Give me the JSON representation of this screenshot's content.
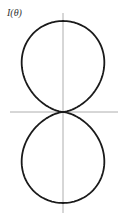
{
  "diagram": {
    "label": "I(θ)",
    "type": "polar-radiation-pattern",
    "colors": {
      "curve": "#1a1a1a",
      "axes": "#999999",
      "background": "#ffffff"
    }
  },
  "chart_data": {
    "type": "line",
    "title": "I(θ)",
    "xlabel": "",
    "ylabel": "I(θ)",
    "form": "polar, I(θ) ∝ cos²θ (lobes along vertical axis)",
    "origin_px": [
      63,
      112
    ],
    "lobe_length_px": 91,
    "series": [
      {
        "name": "upper lobe",
        "extent_y_px": [
          21,
          112
        ],
        "max_width_px": 56
      },
      {
        "name": "lower lobe",
        "extent_y_px": [
          112,
          203
        ],
        "max_width_px": 56
      }
    ],
    "grid": false
  }
}
